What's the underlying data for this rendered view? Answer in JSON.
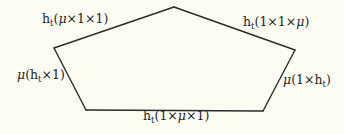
{
  "diagram": {
    "type": "pentagon-commutative-diagram",
    "colors": {
      "background": "#fdfcf3",
      "edge": "#2b2b2b",
      "text": "#1e1e1e"
    },
    "edges": [
      {
        "id": "top-left",
        "prefix": "h",
        "sub": "t",
        "args": [
          "μ",
          "1",
          "1"
        ],
        "text": "h_t(μ×1×1)"
      },
      {
        "id": "top-right",
        "prefix": "h",
        "sub": "t",
        "args": [
          "1",
          "1",
          "μ"
        ],
        "text": "h_t(1×1×μ)"
      },
      {
        "id": "left",
        "prefix": "μ",
        "args": [
          "h_t",
          "1"
        ],
        "text": "μ(h_t×1)"
      },
      {
        "id": "right",
        "prefix": "μ",
        "args": [
          "1",
          "h_t"
        ],
        "text": "μ(1×h_t)"
      },
      {
        "id": "bottom",
        "prefix": "h",
        "sub": "t",
        "args": [
          "1",
          "μ",
          "1"
        ],
        "text": "h_t(1×μ×1)"
      }
    ]
  }
}
